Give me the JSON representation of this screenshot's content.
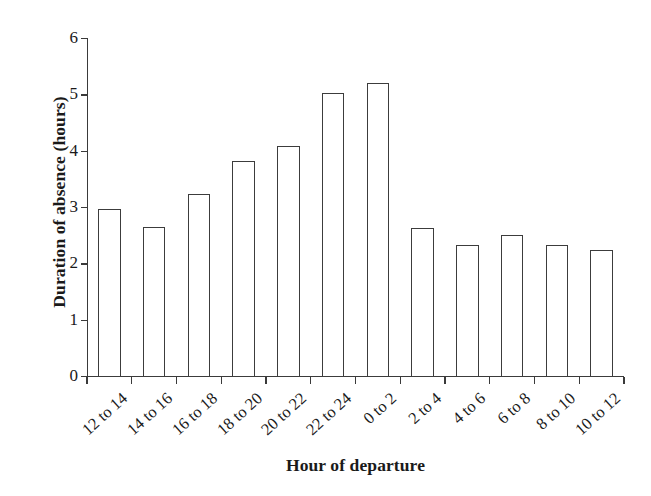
{
  "chart_data": {
    "type": "bar",
    "title": "",
    "xlabel": "Hour of departure",
    "ylabel": "Duration of absence (hours)",
    "categories": [
      "12 to 14",
      "14 to 16",
      "16 to 18",
      "18 to 20",
      "20 to 22",
      "22 to 24",
      "0 to 2",
      "2 to 4",
      "4 to 6",
      "6 to 8",
      "8 to 10",
      "10 to 12"
    ],
    "values": [
      2.96,
      2.65,
      3.23,
      3.81,
      4.09,
      5.02,
      5.21,
      2.62,
      2.32,
      2.51,
      2.32,
      2.23
    ],
    "ylim": [
      0,
      6
    ],
    "yticks": [
      0,
      1,
      2,
      3,
      4,
      5,
      6
    ],
    "yticklabels": [
      "0",
      "1",
      "2",
      "3",
      "4",
      "5",
      "6"
    ],
    "grid": false,
    "legend": false,
    "bar_fill_color": "#ffffff",
    "bar_edge_color": "#3c3c3c",
    "axis_color": "#3a3a3a",
    "background_color": "#ffffff",
    "xtick_label_rotation": -42
  }
}
